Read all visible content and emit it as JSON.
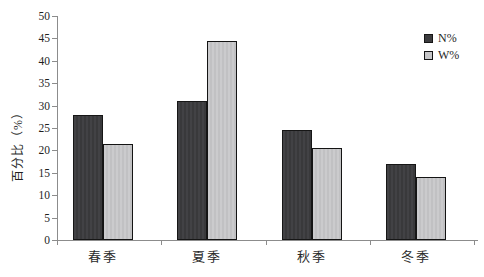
{
  "chart_data": {
    "type": "bar",
    "title": "",
    "categories": [
      "春季",
      "夏季",
      "秋季",
      "冬季"
    ],
    "series": [
      {
        "name": "N%",
        "values": [
          28,
          31,
          24.5,
          17
        ],
        "color": "#3c3c3e",
        "border": "#161616"
      },
      {
        "name": "W%",
        "values": [
          21.5,
          44.5,
          20.5,
          14
        ],
        "color": "#c6c6c8",
        "border": "#141414"
      }
    ],
    "xlabel": "",
    "ylabel": "百分比（%）",
    "ylim": [
      0,
      50
    ],
    "yticks": [
      0,
      5,
      10,
      15,
      20,
      25,
      30,
      35,
      40,
      45,
      50
    ],
    "grid": false,
    "legend_position": "top-right"
  }
}
